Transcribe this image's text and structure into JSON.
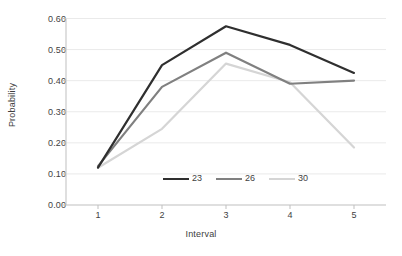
{
  "chart_data": {
    "type": "line",
    "title": "",
    "subtitle": "",
    "xlabel": "Interval",
    "ylabel": "Probability",
    "x": [
      1,
      2,
      3,
      4,
      5
    ],
    "categories": [
      "1",
      "2",
      "3",
      "4",
      "5"
    ],
    "xlim": [
      0.5,
      5.5
    ],
    "ylim": [
      0.0,
      0.6
    ],
    "ytick_labels": [
      "0.00",
      "0.10",
      "0.20",
      "0.30",
      "0.40",
      "0.50",
      "0.60"
    ],
    "ytick_values": [
      0.0,
      0.1,
      0.2,
      0.3,
      0.4,
      0.5,
      0.6
    ],
    "grid": "horizontal",
    "legend_position": "inside-bottom-center",
    "series": [
      {
        "name": "23",
        "color": "#2f2f2f",
        "width": 2.2,
        "values": [
          0.12,
          0.45,
          0.575,
          0.515,
          0.425
        ]
      },
      {
        "name": "26",
        "color": "#808080",
        "width": 2.2,
        "values": [
          0.125,
          0.38,
          0.49,
          0.39,
          0.4
        ]
      },
      {
        "name": "30",
        "color": "#d5d5d5",
        "width": 2.2,
        "values": [
          0.12,
          0.245,
          0.455,
          0.395,
          0.185
        ]
      }
    ],
    "axis_color": "#bfbfbf",
    "grid_color": "#eaeaea",
    "text_color": "#3f3f3f"
  }
}
